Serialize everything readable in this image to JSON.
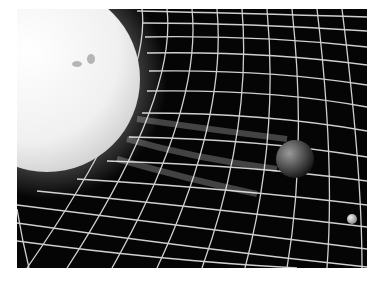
{
  "image": {
    "description": "Illustration of the Sun warping a spacetime grid, with Earth and the Moon resting in the curved fabric",
    "subjects": [
      "sun",
      "spacetime-grid",
      "earth",
      "moon"
    ],
    "colors": {
      "background": "#050505",
      "grid": "#e8e8e8",
      "sun": "#f4f4f4",
      "sun_edge": "#d8d8d8",
      "earth": "#6a6a6a",
      "moon": "#cfcfcf",
      "border": "#ffffff"
    }
  }
}
